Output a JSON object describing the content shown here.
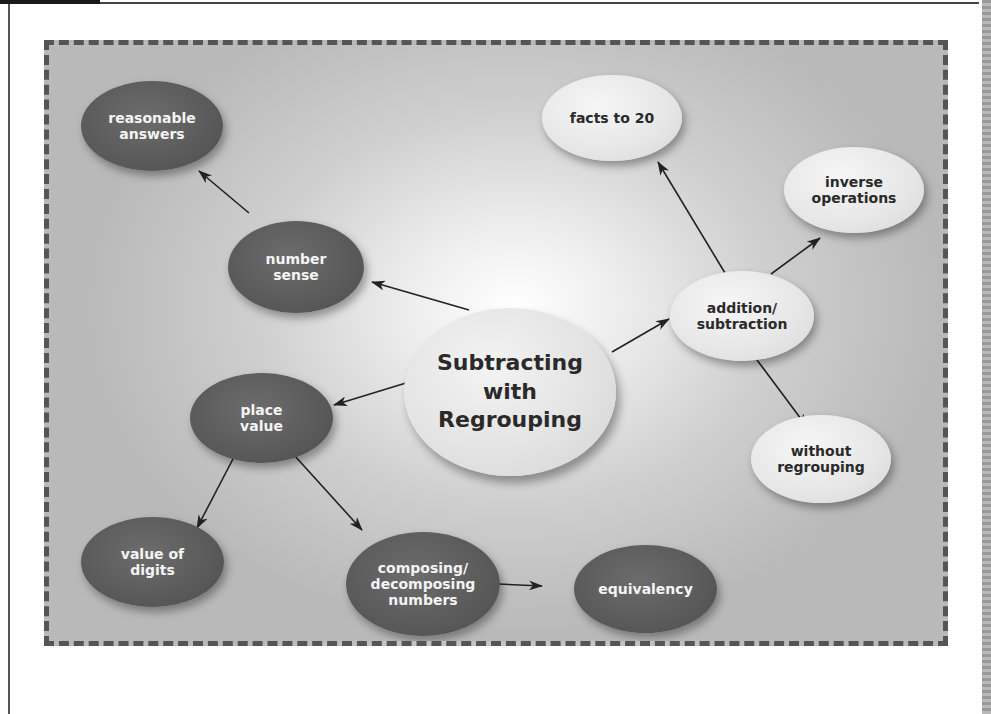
{
  "concept_map": {
    "center": {
      "label": "Subtracting\nwith\nRegrouping"
    },
    "nodes": {
      "reasonable_answers": {
        "label": "reasonable\nanswers",
        "style": "dark"
      },
      "number_sense": {
        "label": "number\nsense",
        "style": "dark"
      },
      "place_value": {
        "label": "place\nvalue",
        "style": "dark"
      },
      "value_of_digits": {
        "label": "value of\ndigits",
        "style": "dark"
      },
      "composing_decomposing": {
        "label": "composing/\ndecomposing\nnumbers",
        "style": "dark"
      },
      "equivalency": {
        "label": "equivalency",
        "style": "dark"
      },
      "facts_to_20": {
        "label": "facts to 20",
        "style": "light"
      },
      "inverse_operations": {
        "label": "inverse\noperations",
        "style": "light"
      },
      "addition_subtraction": {
        "label": "addition/\nsubtraction",
        "style": "light"
      },
      "without_regrouping": {
        "label": "without\nregrouping",
        "style": "light"
      }
    },
    "edges": [
      {
        "from": "Subtracting with Regrouping",
        "to": "number sense"
      },
      {
        "from": "number sense",
        "to": "reasonable answers"
      },
      {
        "from": "Subtracting with Regrouping",
        "to": "place value"
      },
      {
        "from": "place value",
        "to": "value of digits"
      },
      {
        "from": "place value",
        "to": "composing/decomposing numbers"
      },
      {
        "from": "composing/decomposing numbers",
        "to": "equivalency"
      },
      {
        "from": "Subtracting with Regrouping",
        "to": "addition/subtraction"
      },
      {
        "from": "addition/subtraction",
        "to": "facts to 20"
      },
      {
        "from": "addition/subtraction",
        "to": "inverse operations"
      },
      {
        "from": "addition/subtraction",
        "to": "without regrouping"
      }
    ],
    "colors": {
      "dark_node": "#5a5a5a",
      "light_node": "#e4e4e4",
      "frame_border": "#555555",
      "arrow": "#222222"
    }
  }
}
